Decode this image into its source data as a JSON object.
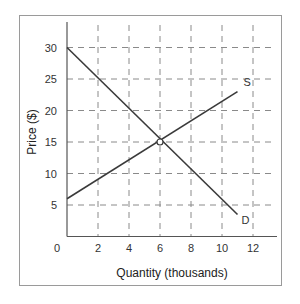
{
  "chart_data": {
    "type": "line",
    "title": "",
    "xlabel": "Quantity (thousands)",
    "ylabel": "Price ($)",
    "xlim": [
      0,
      13
    ],
    "ylim": [
      0,
      33
    ],
    "x_ticks": [
      "0",
      "2",
      "4",
      "6",
      "8",
      "10",
      "12"
    ],
    "y_ticks": [
      "5",
      "10",
      "15",
      "20",
      "25",
      "30"
    ],
    "grid": true,
    "grid_style": "dashed",
    "series": [
      {
        "name": "D",
        "label": "D",
        "x": [
          0,
          11
        ],
        "y": [
          30,
          3.5
        ],
        "description": "Demand curve"
      },
      {
        "name": "S",
        "label": "S",
        "x": [
          0,
          11
        ],
        "y": [
          6,
          23
        ],
        "description": "Supply curve"
      }
    ],
    "annotations": [
      {
        "type": "equilibrium-point",
        "x": 6,
        "y": 15
      }
    ]
  },
  "colors": {
    "line": "#3a3a3a",
    "grid": "#8a8a8a",
    "frame": "#9a9a9a"
  }
}
